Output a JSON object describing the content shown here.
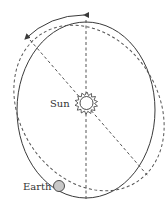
{
  "diagram": {
    "title": "",
    "labels": {
      "sun": "Sun",
      "earth": "Earth"
    },
    "elements": {
      "current_orbit": "solid ellipse",
      "precessed_orbit": "dashed ellipse",
      "major_axis_original": "vertical dashed line",
      "major_axis_rotated": "diagonal dashed line",
      "precession_arrow": "curved double-headed arrow"
    },
    "colors": {
      "line": "#3a3a3a",
      "earth_fill": "#c8c8c8",
      "sun_fill": "#ffffff"
    }
  }
}
